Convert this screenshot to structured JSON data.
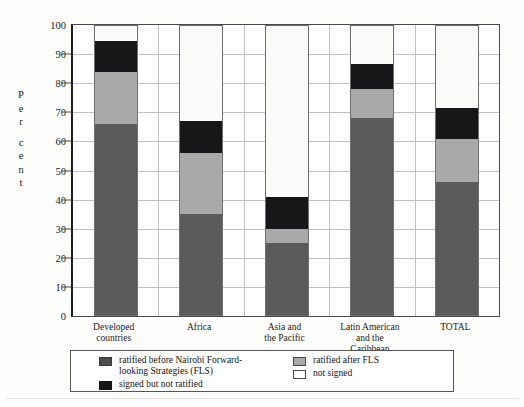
{
  "figure": {
    "faint_top_text": "",
    "ylabel_chars": [
      "P",
      "e",
      "r",
      "c",
      "e",
      "n",
      "t"
    ]
  },
  "legend": {
    "items": [
      {
        "key": "before",
        "label": "ratified before Nairobi Forward-\nlooking Strategies (FLS)",
        "swatch": "dark-gray-swatch",
        "color": "#4d4d4d"
      },
      {
        "key": "signed",
        "label": "signed but not ratified",
        "swatch": "black-swatch",
        "color": "#17171a"
      },
      {
        "key": "after",
        "label": "ratified after FLS",
        "swatch": "light-gray-swatch",
        "color": "#a9a9a9"
      },
      {
        "key": "notsigned",
        "label": "not signed",
        "swatch": "white-swatch",
        "color": "#ffffff"
      }
    ]
  },
  "chart_data": {
    "type": "bar",
    "title": "",
    "xlabel": "",
    "ylabel": "Per cent",
    "ylim": [
      0,
      100
    ],
    "yticks": [
      0,
      10,
      20,
      30,
      40,
      50,
      60,
      70,
      80,
      90,
      100
    ],
    "grid": true,
    "stacked": true,
    "legend_position": "bottom",
    "categories": [
      "Developed\ncountries",
      "Africa",
      "Asia and\nthe Pacific",
      "Latin American\nand the\nCaribbean",
      "TOTAL"
    ],
    "series": [
      {
        "name": "ratified before Nairobi Forward-looking Strategies (FLS)",
        "color": "#5b5b5b",
        "values": [
          66,
          35,
          25,
          68,
          46
        ]
      },
      {
        "name": "ratified after FLS",
        "color": "#a9a9a9",
        "values": [
          18,
          21,
          5,
          10,
          15
        ]
      },
      {
        "name": "signed but not ratified",
        "color": "#17171a",
        "values": [
          10.5,
          11,
          11,
          8.5,
          10.5
        ]
      },
      {
        "name": "not signed",
        "color": "#ffffff",
        "values": [
          5.5,
          33,
          59,
          13.5,
          28.5
        ]
      }
    ],
    "totals_ratified_or_signed": [
      94.5,
      67,
      41,
      86.5,
      71.5
    ]
  }
}
